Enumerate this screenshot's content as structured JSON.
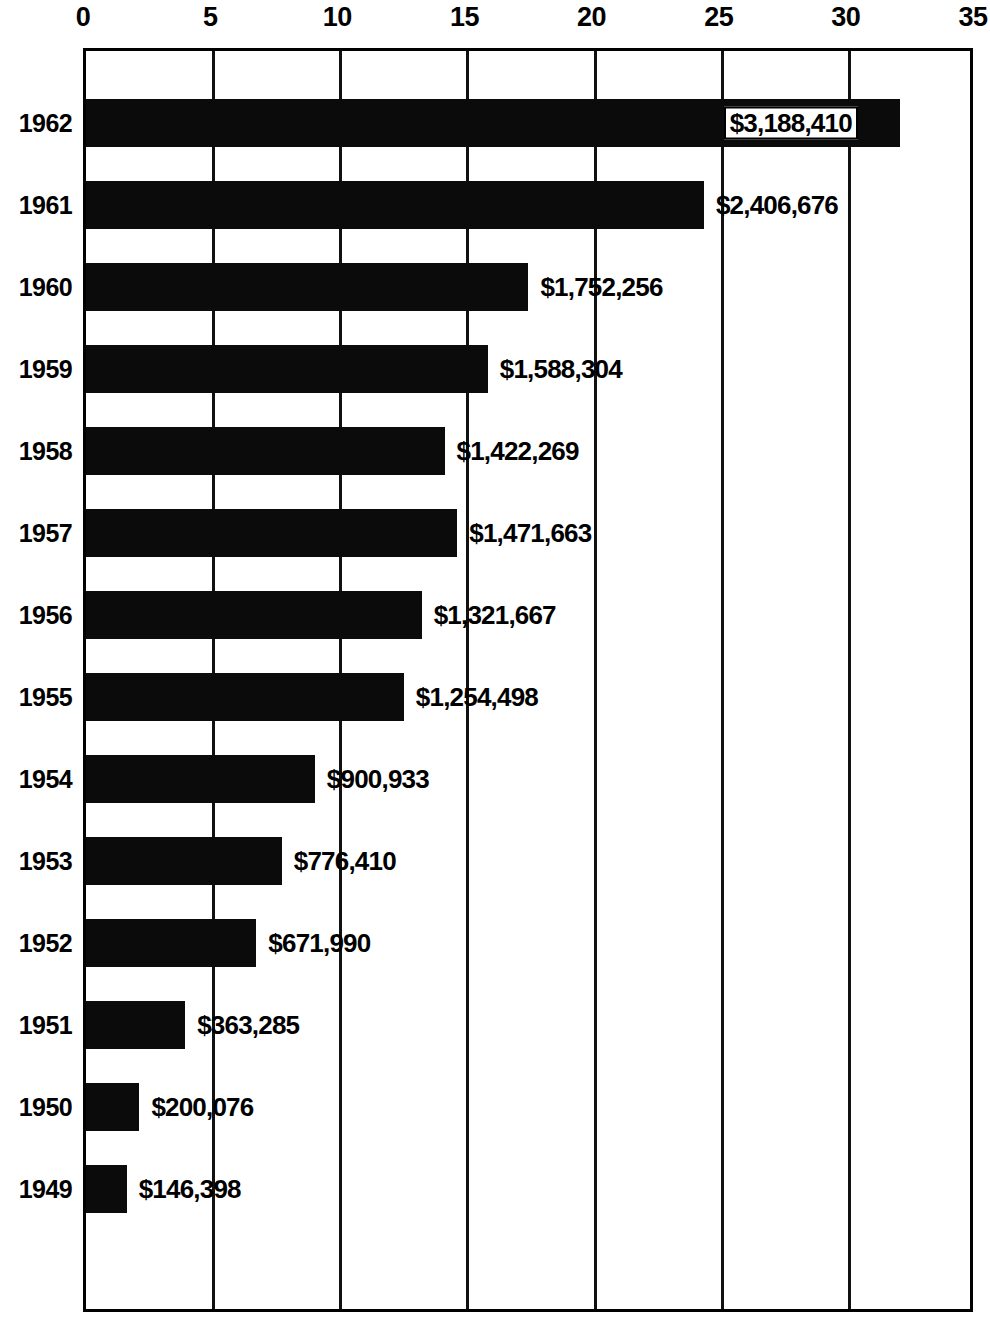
{
  "chart_data": {
    "type": "bar",
    "orientation": "horizontal",
    "title": "",
    "xlabel": "",
    "ylabel": "",
    "xlim": [
      0,
      35
    ],
    "ylim": null,
    "grid": true,
    "legend": null,
    "x_ticks": [
      "0",
      "5",
      "10",
      "15",
      "20",
      "25",
      "30",
      "35"
    ],
    "x_tick_values": [
      0,
      5,
      10,
      15,
      20,
      25,
      30,
      35
    ],
    "categories": [
      "1962",
      "1961",
      "1960",
      "1959",
      "1958",
      "1957",
      "1956",
      "1955",
      "1954",
      "1953",
      "1952",
      "1951",
      "1950",
      "1949"
    ],
    "values": [
      32.0,
      24.3,
      17.4,
      15.8,
      14.1,
      14.6,
      13.2,
      12.5,
      9.0,
      7.7,
      6.7,
      3.9,
      2.1,
      1.6
    ],
    "data_labels": [
      "$3,188,410",
      "$2,406,676",
      "$1,752,256",
      "$1,588,304",
      "$1,422,269",
      "$1,471,663",
      "$1,321,667",
      "$1,254,498",
      "$900,933",
      "$776,410",
      "$671,990",
      "$363,285",
      "$200,076",
      "$146,398"
    ],
    "label_placement": [
      "inside",
      "outside",
      "outside",
      "outside",
      "outside",
      "outside",
      "outside",
      "outside",
      "outside",
      "outside",
      "outside",
      "outside",
      "outside",
      "outside"
    ],
    "bar_color": "#0b0b0b",
    "background_color": "#ffffff",
    "axis_color": "#000000"
  },
  "bars": [
    {
      "year": "1962",
      "value": 32.0,
      "label": "$3,188,410",
      "placement": "inside"
    },
    {
      "year": "1961",
      "value": 24.3,
      "label": "$2,406,676",
      "placement": "outside"
    },
    {
      "year": "1960",
      "value": 17.4,
      "label": "$1,752,256",
      "placement": "outside"
    },
    {
      "year": "1959",
      "value": 15.8,
      "label": "$1,588,304",
      "placement": "outside"
    },
    {
      "year": "1958",
      "value": 14.1,
      "label": "$1,422,269",
      "placement": "outside"
    },
    {
      "year": "1957",
      "value": 14.6,
      "label": "$1,471,663",
      "placement": "outside"
    },
    {
      "year": "1956",
      "value": 13.2,
      "label": "$1,321,667",
      "placement": "outside"
    },
    {
      "year": "1955",
      "value": 12.5,
      "label": "$1,254,498",
      "placement": "outside"
    },
    {
      "year": "1954",
      "value": 9.0,
      "label": "$900,933",
      "placement": "outside"
    },
    {
      "year": "1953",
      "value": 7.7,
      "label": "$776,410",
      "placement": "outside"
    },
    {
      "year": "1952",
      "value": 6.7,
      "label": "$671,990",
      "placement": "outside"
    },
    {
      "year": "1951",
      "value": 3.9,
      "label": "$363,285",
      "placement": "outside"
    },
    {
      "year": "1950",
      "value": 2.1,
      "label": "$200,076",
      "placement": "outside"
    },
    {
      "year": "1949",
      "value": 1.6,
      "label": "$146,398",
      "placement": "outside"
    }
  ],
  "x_ticks": [
    {
      "label": "0",
      "value": 0
    },
    {
      "label": "5",
      "value": 5
    },
    {
      "label": "10",
      "value": 10
    },
    {
      "label": "15",
      "value": 15
    },
    {
      "label": "20",
      "value": 20
    },
    {
      "label": "25",
      "value": 25
    },
    {
      "label": "30",
      "value": 30
    },
    {
      "label": "35",
      "value": 35
    }
  ]
}
